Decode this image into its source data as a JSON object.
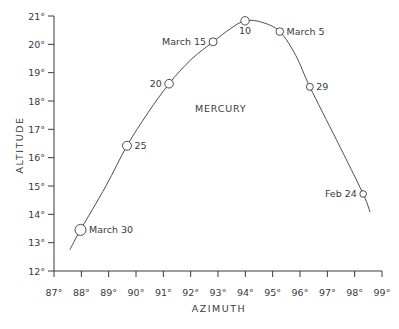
{
  "chart_data": {
    "type": "line",
    "title": "",
    "xlabel": "AZIMUTH",
    "ylabel": "ALTITUDE",
    "xlim": [
      87,
      99
    ],
    "ylim": [
      12,
      21
    ],
    "grid": false,
    "legend": null,
    "x_ticks": [
      "87°",
      "88°",
      "89°",
      "90°",
      "91°",
      "92°",
      "93°",
      "94°",
      "95°",
      "96°",
      "97°",
      "98°",
      "99°"
    ],
    "y_ticks": [
      "12°",
      "13°",
      "14°",
      "15°",
      "16°",
      "17°",
      "18°",
      "19°",
      "20°",
      "21°"
    ],
    "annotations": [
      {
        "text": "MERCURY",
        "x": 93.1,
        "y": 17.6
      }
    ],
    "series": [
      {
        "name": "Mercury",
        "curve": [
          {
            "x": 87.58,
            "y": 12.75
          },
          {
            "x": 87.97,
            "y": 13.45
          },
          {
            "x": 88.9,
            "y": 15.0
          },
          {
            "x": 89.67,
            "y": 16.42
          },
          {
            "x": 90.45,
            "y": 17.6
          },
          {
            "x": 91.21,
            "y": 18.61
          },
          {
            "x": 92.0,
            "y": 19.45
          },
          {
            "x": 92.82,
            "y": 20.09
          },
          {
            "x": 93.45,
            "y": 20.55
          },
          {
            "x": 93.99,
            "y": 20.83
          },
          {
            "x": 94.6,
            "y": 20.78
          },
          {
            "x": 95.26,
            "y": 20.45
          },
          {
            "x": 95.85,
            "y": 19.6
          },
          {
            "x": 96.36,
            "y": 18.5
          },
          {
            "x": 97.35,
            "y": 16.6
          },
          {
            "x": 98.31,
            "y": 14.72
          },
          {
            "x": 98.56,
            "y": 14.08
          }
        ],
        "points": [
          {
            "label": "March 30",
            "x": 87.97,
            "y": 13.45,
            "r": 5.5,
            "label_pos": "right"
          },
          {
            "label": "25",
            "x": 89.67,
            "y": 16.42,
            "r": 4.5,
            "label_pos": "right"
          },
          {
            "label": "20",
            "x": 91.21,
            "y": 18.61,
            "r": 4.3,
            "label_pos": "left"
          },
          {
            "label": "March 15",
            "x": 92.82,
            "y": 20.09,
            "r": 4.0,
            "label_pos": "left"
          },
          {
            "label": "10",
            "x": 93.99,
            "y": 20.83,
            "r": 4.2,
            "label_pos": "below"
          },
          {
            "label": "March 5",
            "x": 95.26,
            "y": 20.45,
            "r": 3.8,
            "label_pos": "right"
          },
          {
            "label": "29",
            "x": 96.36,
            "y": 18.5,
            "r": 3.5,
            "label_pos": "right"
          },
          {
            "label": "Feb 24",
            "x": 98.31,
            "y": 14.72,
            "r": 3.3,
            "label_pos": "left"
          }
        ]
      }
    ]
  },
  "colors": {
    "ink": "#3a3a3a",
    "background": "#ffffff"
  }
}
